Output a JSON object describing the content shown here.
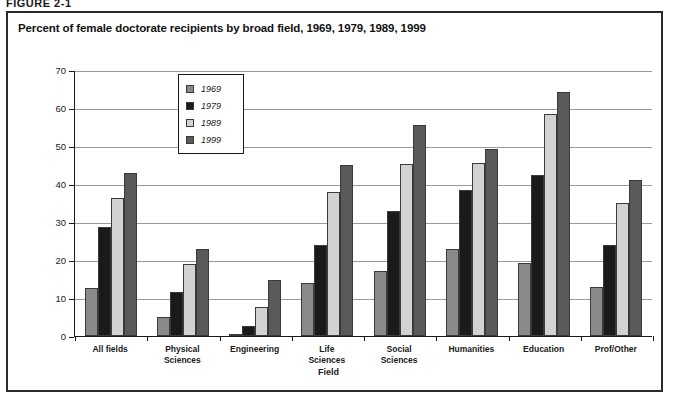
{
  "figure": {
    "number_label": "FIGURE 2-1",
    "title": "Percent of female doctorate recipients by broad field, 1969, 1979, 1989, 1999",
    "caption": ""
  },
  "legend": {
    "position": "inside-plot-left",
    "entries": [
      {
        "label": "1969",
        "color": "#8a8a8a"
      },
      {
        "label": "1979",
        "color": "#1a1a1a"
      },
      {
        "label": "1989",
        "color": "#d2d2d2"
      },
      {
        "label": "1999",
        "color": "#5a5a5a"
      }
    ]
  },
  "axes": {
    "y_title": "Percent female",
    "x_title": "Field",
    "y_ticks": [
      0,
      10,
      20,
      30,
      40,
      50,
      60,
      70
    ]
  },
  "chart_data": {
    "type": "bar",
    "title": "Percent of female doctorate recipients by broad field, 1969, 1979, 1989, 1999",
    "xlabel": "Field",
    "ylabel": "Percent female",
    "ylim": [
      0,
      70
    ],
    "yticks": [
      0,
      10,
      20,
      30,
      40,
      50,
      60,
      70
    ],
    "grid": true,
    "legend_position": "upper left inside plot",
    "categories": [
      "All fields",
      "Physical Sciences",
      "Engineering",
      "Life Sciences",
      "Social Sciences",
      "Humanities",
      "Education",
      "Prof/Other"
    ],
    "series": [
      {
        "name": "1969",
        "color": "#8a8a8a",
        "values": [
          12.7,
          5.0,
          0.4,
          14.0,
          17.1,
          23.0,
          19.3,
          12.9
        ]
      },
      {
        "name": "1979",
        "color": "#1a1a1a",
        "values": [
          28.7,
          11.7,
          2.7,
          24.0,
          33.0,
          38.3,
          42.5,
          24.0
        ]
      },
      {
        "name": "1989",
        "color": "#d2d2d2",
        "values": [
          36.4,
          19.0,
          7.7,
          38.0,
          45.3,
          45.5,
          58.5,
          35.0
        ]
      },
      {
        "name": "1999",
        "color": "#5a5a5a",
        "values": [
          43.0,
          23.0,
          14.8,
          45.0,
          55.4,
          49.3,
          64.2,
          41.0
        ]
      }
    ]
  }
}
